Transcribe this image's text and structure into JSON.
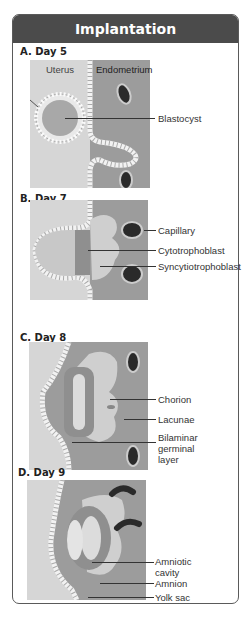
{
  "title": "Implantation",
  "colors": {
    "header_bg": "#4b4b4b",
    "uterus": "#d4d4d4",
    "endometrium": "#9a9a9a",
    "capillary": "#2a2a2a",
    "trophoblast": "#b8b8b8"
  },
  "panels": [
    {
      "label": "A. Day 5",
      "top_labels": [
        "Uterus",
        "Endometrium"
      ],
      "annotations": [
        "Blastocyst"
      ]
    },
    {
      "label": "B. Day 7",
      "annotations": [
        "Capillary",
        "Cytotrophoblast",
        "Syncytiotrophoblast"
      ]
    },
    {
      "label": "C. Day 8",
      "annotations": [
        "Chorion",
        "Lacunae",
        "Bilaminar germinal layer"
      ],
      "annotation_lines": [
        "Bilaminar",
        "germinal",
        "layer"
      ]
    },
    {
      "label": "D. Day 9",
      "annotations": [
        "Amniotic cavity",
        "Amnion",
        "Yolk sac"
      ],
      "annotation_lines": [
        "Amniotic",
        "cavity"
      ]
    }
  ]
}
